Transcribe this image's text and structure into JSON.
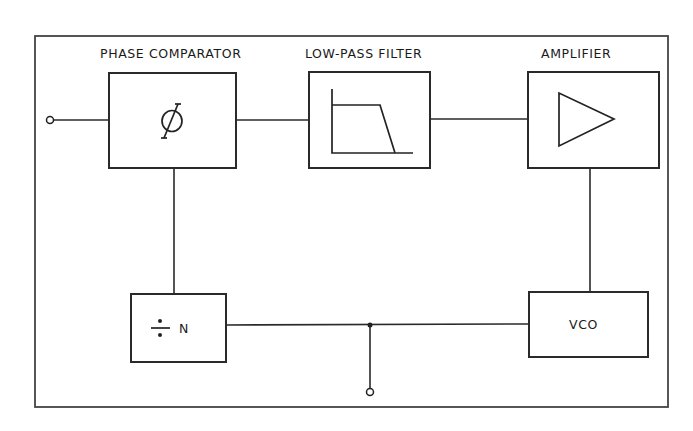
{
  "diagram": {
    "labels": {
      "phase_comparator": "PHASE COMPARATOR",
      "low_pass_filter": "LOW-PASS FILTER",
      "amplifier": "AMPLIFIER"
    },
    "blocks": {
      "phase_comparator": {
        "symbol": "phi-icon",
        "text": "Ø"
      },
      "low_pass_filter": {
        "symbol": "lowpass-response-icon"
      },
      "amplifier": {
        "symbol": "triangle-amplifier-icon"
      },
      "divider": {
        "symbol_text": "÷",
        "text": "N"
      },
      "vco": {
        "text": "VCO"
      }
    },
    "terminals": {
      "input": "input-terminal",
      "output": "output-terminal"
    },
    "colors": {
      "line": "#2a2a2a",
      "background": "#ffffff"
    }
  }
}
